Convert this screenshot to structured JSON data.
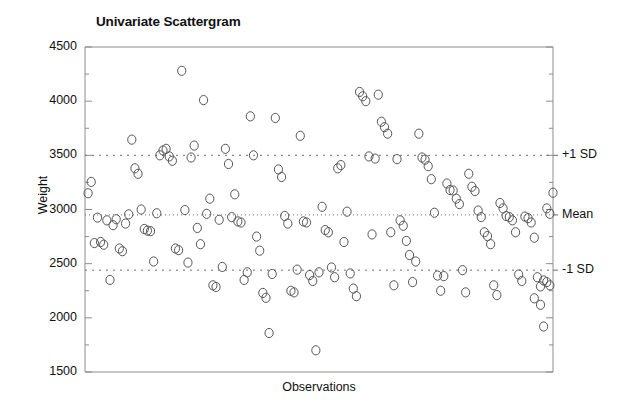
{
  "chart_data": {
    "type": "scatter",
    "title": "Univariate Scattergram",
    "xlabel": "Observations",
    "ylabel": "Weight",
    "ylim": [
      1500,
      4500
    ],
    "yticks": [
      1500,
      2000,
      2500,
      3000,
      3500,
      4000,
      4500
    ],
    "ytick_labels": [
      "1500",
      "2000",
      "2500",
      "3000",
      "3500",
      "4000",
      "4500"
    ],
    "minor_tick_step": 250,
    "grid": false,
    "legend": "none",
    "marker": "open-circle",
    "marker_color": "#555555",
    "reference_lines": [
      {
        "name": "+1 SD",
        "label": "+1 SD",
        "value": 3500,
        "style": "dotted"
      },
      {
        "name": "Mean",
        "label": "Mean",
        "value": 2950,
        "style": "dotted"
      },
      {
        "name": "-1 SD",
        "label": "-1 SD",
        "value": 2440,
        "style": "dotted"
      }
    ],
    "x_range": [
      0,
      150
    ],
    "x_axis_ticks_visible": false,
    "n_points": 150,
    "points": [
      [
        2,
        3255
      ],
      [
        4,
        2925
      ],
      [
        5,
        2700
      ],
      [
        6,
        2675
      ],
      [
        7,
        2900
      ],
      [
        9,
        2855
      ],
      [
        11,
        2640
      ],
      [
        12,
        2615
      ],
      [
        13,
        2870
      ],
      [
        15,
        3645
      ],
      [
        16,
        3380
      ],
      [
        17,
        3330
      ],
      [
        18,
        3000
      ],
      [
        19,
        2820
      ],
      [
        20,
        2805
      ],
      [
        21,
        2800
      ],
      [
        22,
        2520
      ],
      [
        24,
        3500
      ],
      [
        25,
        3545
      ],
      [
        26,
        3560
      ],
      [
        27,
        3490
      ],
      [
        28,
        3450
      ],
      [
        29,
        2640
      ],
      [
        30,
        2625
      ],
      [
        31,
        4280
      ],
      [
        33,
        2510
      ],
      [
        34,
        3480
      ],
      [
        35,
        3590
      ],
      [
        36,
        2830
      ],
      [
        37,
        2680
      ],
      [
        38,
        4010
      ],
      [
        40,
        3100
      ],
      [
        41,
        2300
      ],
      [
        42,
        2285
      ],
      [
        43,
        2905
      ],
      [
        45,
        3560
      ],
      [
        46,
        3420
      ],
      [
        47,
        2930
      ],
      [
        48,
        3140
      ],
      [
        49,
        2890
      ],
      [
        50,
        2880
      ],
      [
        51,
        2350
      ],
      [
        53,
        3860
      ],
      [
        54,
        3500
      ],
      [
        55,
        2750
      ],
      [
        56,
        2620
      ],
      [
        57,
        2230
      ],
      [
        58,
        2185
      ],
      [
        59,
        1860
      ],
      [
        61,
        3845
      ],
      [
        62,
        3370
      ],
      [
        63,
        3300
      ],
      [
        64,
        2940
      ],
      [
        65,
        2870
      ],
      [
        66,
        2250
      ],
      [
        67,
        2235
      ],
      [
        69,
        3680
      ],
      [
        70,
        2890
      ],
      [
        71,
        2880
      ],
      [
        72,
        2395
      ],
      [
        73,
        2340
      ],
      [
        74,
        1700
      ],
      [
        76,
        3025
      ],
      [
        77,
        2810
      ],
      [
        78,
        2790
      ],
      [
        79,
        2465
      ],
      [
        81,
        3380
      ],
      [
        82,
        3410
      ],
      [
        83,
        2700
      ],
      [
        85,
        2410
      ],
      [
        86,
        2270
      ],
      [
        87,
        2200
      ],
      [
        88,
        4085
      ],
      [
        89,
        4045
      ],
      [
        90,
        4000
      ],
      [
        91,
        3490
      ],
      [
        92,
        2770
      ],
      [
        94,
        4060
      ],
      [
        95,
        3810
      ],
      [
        96,
        3760
      ],
      [
        97,
        3700
      ],
      [
        98,
        2790
      ],
      [
        99,
        2300
      ],
      [
        101,
        2900
      ],
      [
        102,
        2850
      ],
      [
        103,
        2710
      ],
      [
        104,
        2580
      ],
      [
        105,
        2330
      ],
      [
        107,
        3700
      ],
      [
        108,
        3480
      ],
      [
        109,
        3460
      ],
      [
        110,
        3400
      ],
      [
        111,
        3280
      ],
      [
        112,
        2970
      ],
      [
        113,
        2390
      ],
      [
        114,
        2250
      ],
      [
        116,
        3240
      ],
      [
        117,
        3180
      ],
      [
        118,
        3175
      ],
      [
        119,
        3100
      ],
      [
        120,
        3050
      ],
      [
        121,
        2440
      ],
      [
        123,
        3330
      ],
      [
        124,
        3210
      ],
      [
        125,
        3170
      ],
      [
        126,
        2990
      ],
      [
        127,
        2930
      ],
      [
        128,
        2790
      ],
      [
        129,
        2755
      ],
      [
        130,
        2680
      ],
      [
        131,
        2300
      ],
      [
        133,
        3060
      ],
      [
        134,
        3010
      ],
      [
        135,
        2940
      ],
      [
        136,
        2930
      ],
      [
        137,
        2900
      ],
      [
        138,
        2790
      ],
      [
        139,
        2400
      ],
      [
        141,
        2935
      ],
      [
        142,
        2920
      ],
      [
        143,
        2880
      ],
      [
        144,
        2740
      ],
      [
        145,
        2375
      ],
      [
        146,
        2290
      ],
      [
        147,
        1920
      ],
      [
        148,
        3010
      ],
      [
        149,
        2960
      ],
      [
        23,
        2965
      ],
      [
        32,
        2995
      ],
      [
        39,
        2960
      ],
      [
        44,
        2470
      ],
      [
        52,
        2420
      ],
      [
        60,
        2405
      ],
      [
        68,
        2445
      ],
      [
        75,
        2420
      ],
      [
        80,
        2375
      ],
      [
        84,
        2980
      ],
      [
        93,
        3470
      ],
      [
        100,
        3465
      ],
      [
        106,
        2520
      ],
      [
        115,
        2385
      ],
      [
        122,
        2235
      ],
      [
        132,
        2210
      ],
      [
        140,
        2340
      ],
      [
        8,
        2350
      ],
      [
        10,
        2910
      ],
      [
        14,
        2955
      ],
      [
        3,
        2690
      ],
      [
        1,
        3150
      ],
      [
        150,
        3155
      ],
      [
        144,
        2180
      ],
      [
        146,
        2120
      ],
      [
        147,
        2345
      ],
      [
        148,
        2330
      ],
      [
        149,
        2300
      ]
    ]
  },
  "axes": {
    "left": 85,
    "right": 553,
    "top": 47,
    "bottom": 372
  }
}
